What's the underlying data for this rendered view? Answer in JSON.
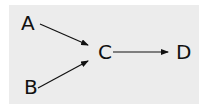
{
  "diagram": {
    "type": "directed-graph",
    "nodes": [
      {
        "id": "A",
        "label": "A"
      },
      {
        "id": "B",
        "label": "B"
      },
      {
        "id": "C",
        "label": "C"
      },
      {
        "id": "D",
        "label": "D"
      }
    ],
    "edges": [
      {
        "from": "A",
        "to": "C"
      },
      {
        "from": "B",
        "to": "C"
      },
      {
        "from": "C",
        "to": "D"
      }
    ],
    "colors": {
      "background": "#ececec",
      "stroke": "#111111"
    }
  }
}
